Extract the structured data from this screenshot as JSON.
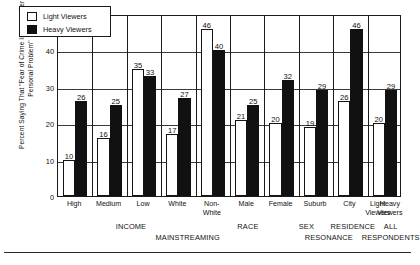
{
  "chart_data": {
    "type": "bar",
    "title": "",
    "xlabel": "",
    "ylabel": "Percent Saying That \"Fear of Crime Is a Very Serious Personal Problem\"",
    "ylim": [
      0,
      50
    ],
    "yticks": [
      0,
      10,
      20,
      30,
      40,
      50
    ],
    "grid": true,
    "legend_position": "top-left",
    "categories": [
      "High",
      "Medium",
      "Low",
      "White",
      "Non-White",
      "Male",
      "Female",
      "Suburb",
      "City",
      "All Respondents"
    ],
    "series": [
      {
        "name": "Light Viewers",
        "color": "#ffffff",
        "values": [
          10,
          16,
          35,
          17,
          46,
          21,
          20,
          19,
          26,
          20
        ]
      },
      {
        "name": "Heavy Viewers",
        "color": "#111111",
        "values": [
          26,
          25,
          33,
          27,
          40,
          25,
          32,
          29,
          46,
          29
        ]
      }
    ],
    "groups": [
      {
        "label": "INCOME",
        "span": [
          0,
          2
        ]
      },
      {
        "label": "RACE",
        "span": [
          3,
          4
        ]
      },
      {
        "label": "SEX",
        "span": [
          5,
          6
        ]
      },
      {
        "label": "RESIDENCE",
        "span": [
          7,
          8
        ]
      },
      {
        "label": "ALL",
        "span": [
          9,
          9
        ]
      }
    ],
    "supergroups": [
      {
        "label": "MAINSTREAMING",
        "span": [
          0,
          4
        ]
      },
      {
        "label": "RESONANCE",
        "span": [
          5,
          8
        ]
      },
      {
        "label": "RESPONDENTS",
        "span": [
          9,
          9
        ]
      }
    ]
  },
  "axis": {
    "ticks": [
      "50",
      "40",
      "30",
      "20",
      "10",
      "0"
    ]
  },
  "legend": {
    "items": [
      {
        "label": "Light Viewers",
        "style": "light"
      },
      {
        "label": "Heavy Viewers",
        "style": "heavy"
      }
    ]
  },
  "category_labels": [
    {
      "line1": "High",
      "line2": ""
    },
    {
      "line1": "Medium",
      "line2": ""
    },
    {
      "line1": "Low",
      "line2": ""
    },
    {
      "line1": "White",
      "line2": ""
    },
    {
      "line1": "Non-",
      "line2": "White"
    },
    {
      "line1": "Male",
      "line2": ""
    },
    {
      "line1": "Female",
      "line2": ""
    },
    {
      "line1": "Suburb",
      "line2": ""
    },
    {
      "line1": "City",
      "line2": ""
    },
    {
      "line1": "Light",
      "line2": "Viewers"
    },
    {
      "line1": "Heavy",
      "line2": "Viewers"
    }
  ],
  "group_labels": {
    "row1": [
      {
        "text": "INCOME",
        "center_pct": 21.5
      },
      {
        "text": "RACE",
        "center_pct": 55.5
      },
      {
        "text": "SEX",
        "center_pct": 72.5
      },
      {
        "text": "RESIDENCE",
        "center_pct": 86.0
      },
      {
        "text": "ALL",
        "center_pct": 97.0
      }
    ],
    "row2": [
      {
        "text": "MAINSTREAMING",
        "center_pct": 38.0
      },
      {
        "text": "RESONANCE",
        "center_pct": 79.0
      },
      {
        "text": "RESPONDENTS",
        "center_pct": 97.0
      }
    ]
  }
}
